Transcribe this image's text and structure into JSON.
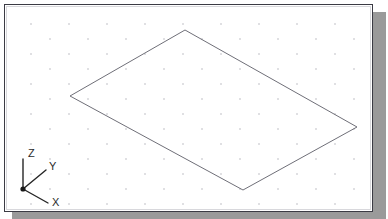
{
  "app": {
    "kind": "cad-viewport",
    "title": "Isometric Drawing Viewport"
  },
  "viewport": {
    "width": 369,
    "height": 208,
    "background_color": "#ffffff",
    "border_color": "#3b3b44",
    "shadow_color": "#9a9a9a"
  },
  "grid": {
    "visible": true,
    "style": "isometric-dot-snap",
    "dot_color": "#b9b9c0",
    "dot_radius": 0.8,
    "column_spacing_px": 38,
    "row_spacing_px": 30,
    "stagger_offset_x_px": 19,
    "stagger_offset_y_px": 15,
    "origin_x_px": 31,
    "origin_y_px": 24
  },
  "geometry": {
    "shapes": [
      {
        "name": "isometric-rectangle",
        "type": "closed-polyline",
        "stroke_color": "#6f6f78",
        "stroke_width": 1,
        "vertices": [
          {
            "label": "top",
            "x": 185,
            "y": 30
          },
          {
            "label": "right",
            "x": 357,
            "y": 127
          },
          {
            "label": "bottom",
            "x": 243,
            "y": 190
          },
          {
            "label": "left",
            "x": 70,
            "y": 96
          }
        ]
      }
    ]
  },
  "ucs_icon": {
    "name": "ucs-coordinate-icon",
    "origin": {
      "x": 23,
      "y": 189
    },
    "axes": [
      {
        "label": "Z",
        "tip_x": 23,
        "tip_y": 159,
        "label_x": 28,
        "label_y": 157
      },
      {
        "label": "Y",
        "tip_x": 46,
        "tip_y": 170,
        "label_x": 49,
        "label_y": 170
      },
      {
        "label": "X",
        "tip_x": 48,
        "tip_y": 203,
        "label_x": 52,
        "label_y": 206
      }
    ],
    "axis_color": "#262626",
    "label_color": "#2a2a2a"
  }
}
